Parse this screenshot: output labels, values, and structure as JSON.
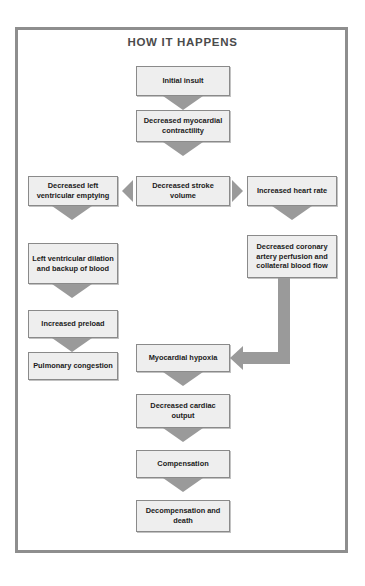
{
  "title": "HOW IT HAPPENS",
  "diagram": {
    "type": "flowchart",
    "nodes": [
      {
        "id": "initial_insult",
        "label": "Initial insult",
        "column": "center"
      },
      {
        "id": "decreased_myocardial_contractility",
        "label": "Decreased myocardial contractility",
        "column": "center"
      },
      {
        "id": "decreased_stroke_volume",
        "label": "Decreased stroke volume",
        "column": "center"
      },
      {
        "id": "decreased_left_ventricular_emptying",
        "label": "Decreased left ventricular emptying",
        "column": "left"
      },
      {
        "id": "increased_heart_rate",
        "label": "Increased heart rate",
        "column": "right"
      },
      {
        "id": "left_ventricular_dilation",
        "label": "Left ventricular dilation and backup of blood",
        "column": "left"
      },
      {
        "id": "decreased_coronary_artery_perfusion",
        "label": "Decreased coronary artery perfusion and collateral blood flow",
        "column": "right"
      },
      {
        "id": "increased_preload",
        "label": "Increased preload",
        "column": "left"
      },
      {
        "id": "pulmonary_congestion",
        "label": "Pulmonary congestion",
        "column": "left"
      },
      {
        "id": "myocardial_hypoxia",
        "label": "Myocardial hypoxia",
        "column": "center"
      },
      {
        "id": "decreased_cardiac_output",
        "label": "Decreased cardiac output",
        "column": "center"
      },
      {
        "id": "compensation",
        "label": "Compensation",
        "column": "center"
      },
      {
        "id": "decompensation_and_death",
        "label": "Decompensation and death",
        "column": "center"
      }
    ],
    "edges": [
      {
        "from": "initial_insult",
        "to": "decreased_myocardial_contractility",
        "direction": "down"
      },
      {
        "from": "decreased_myocardial_contractility",
        "to": "decreased_stroke_volume",
        "direction": "down"
      },
      {
        "from": "decreased_stroke_volume",
        "to": "decreased_left_ventricular_emptying",
        "direction": "left"
      },
      {
        "from": "decreased_stroke_volume",
        "to": "increased_heart_rate",
        "direction": "right"
      },
      {
        "from": "decreased_left_ventricular_emptying",
        "to": "left_ventricular_dilation",
        "direction": "down"
      },
      {
        "from": "left_ventricular_dilation",
        "to": "increased_preload",
        "direction": "down"
      },
      {
        "from": "increased_preload",
        "to": "pulmonary_congestion",
        "direction": "down"
      },
      {
        "from": "increased_heart_rate",
        "to": "decreased_coronary_artery_perfusion",
        "direction": "down"
      },
      {
        "from": "decreased_coronary_artery_perfusion",
        "to": "myocardial_hypoxia",
        "direction": "elbow-down-left"
      },
      {
        "from": "myocardial_hypoxia",
        "to": "decreased_cardiac_output",
        "direction": "down"
      },
      {
        "from": "decreased_cardiac_output",
        "to": "compensation",
        "direction": "down"
      },
      {
        "from": "compensation",
        "to": "decompensation_and_death",
        "direction": "down"
      }
    ],
    "colors": {
      "node_fill": "#eeeeee",
      "node_border": "#8a8a8a",
      "connector": "#9a9a9a",
      "frame": "#8e8e8e",
      "title_text": "#4b4b4b",
      "node_text": "#1b1b1b"
    }
  }
}
